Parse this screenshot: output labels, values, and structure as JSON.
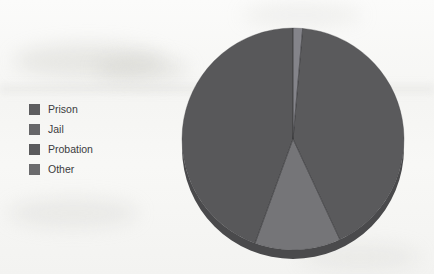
{
  "chart_data": {
    "type": "pie",
    "title": "",
    "subtitle": "",
    "xlabel": "",
    "ylabel": "",
    "grid": false,
    "legend_position": "left",
    "categories": [
      "Prison",
      "Jail",
      "Probation",
      "Other"
    ],
    "values": [
      44.0,
      41.5,
      13.0,
      1.5
    ],
    "value_unit": "percent",
    "slice_order_clockwise_from_top": [
      "Other",
      "Jail",
      "Probation",
      "Prison"
    ],
    "slices": [
      {
        "label": "Prison",
        "value": 44.0,
        "color": "#58585a",
        "start_deg": 200,
        "end_deg": 360
      },
      {
        "label": "Jail",
        "value": 41.5,
        "color": "#5a5a5c",
        "start_deg": 5,
        "end_deg": 155
      },
      {
        "label": "Probation",
        "value": 13.0,
        "color": "#757578",
        "start_deg": 155,
        "end_deg": 200
      },
      {
        "label": "Other",
        "value": 1.5,
        "color": "#84848a",
        "start_deg": 0,
        "end_deg": 5
      }
    ],
    "geometry": {
      "center_x": 293,
      "center_y": 139,
      "radius": 111,
      "depth": 9,
      "style": "3d-pie"
    }
  },
  "legend": {
    "items": [
      {
        "label": "Prison",
        "color": "#5d5d5f"
      },
      {
        "label": "Jail",
        "color": "#666668"
      },
      {
        "label": "Probation",
        "color": "#5a5a5c"
      },
      {
        "label": "Other",
        "color": "#6b6b6d"
      }
    ]
  },
  "colors": {
    "background": "#f7f7f5",
    "text": "#3b3b3d",
    "slice_dark": "#58585a",
    "slice_mid": "#5a5a5c",
    "slice_light": "#757578",
    "slice_lightest": "#84848a",
    "rim_shadow": "#4a4a4c"
  }
}
